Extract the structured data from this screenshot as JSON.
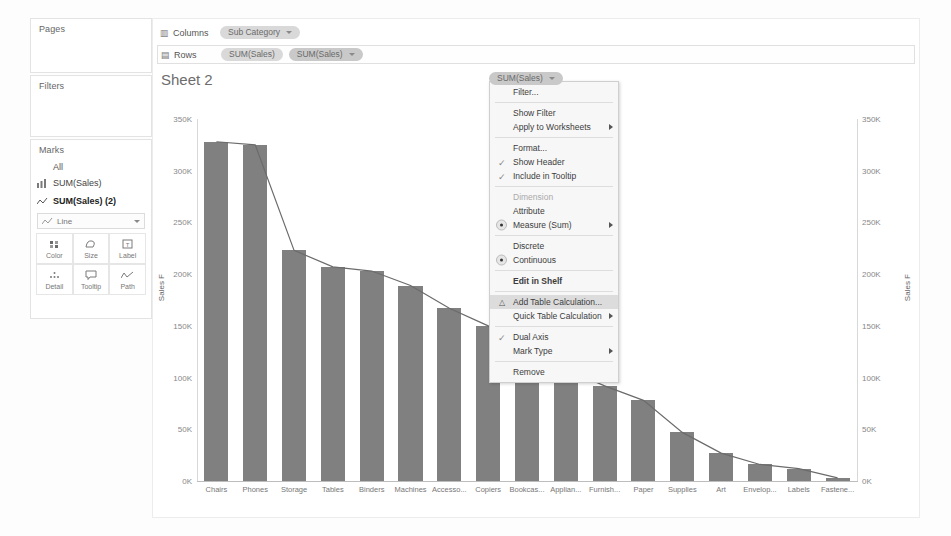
{
  "left_panel": {
    "pages_label": "Pages",
    "filters_label": "Filters",
    "marks_label": "Marks",
    "marks_all": "All",
    "mark_cards": [
      {
        "label": "SUM(Sales)",
        "icon": "bar-chart-icon",
        "selected": false
      },
      {
        "label": "SUM(Sales) (2)",
        "icon": "line-chart-icon",
        "selected": true
      }
    ],
    "mark_type": "Line",
    "buttons": [
      {
        "label": "Color",
        "icon": "color-icon"
      },
      {
        "label": "Size",
        "icon": "size-icon"
      },
      {
        "label": "Label",
        "icon": "label-icon"
      },
      {
        "label": "Detail",
        "icon": "detail-icon"
      },
      {
        "label": "Tooltip",
        "icon": "tooltip-icon"
      },
      {
        "label": "Path",
        "icon": "path-icon"
      }
    ]
  },
  "shelves": {
    "columns_label": "Columns",
    "rows_label": "Rows",
    "columns_pills": [
      "Sub Category"
    ],
    "rows_pills": [
      "SUM(Sales)",
      "SUM(Sales)"
    ]
  },
  "sheet": {
    "title": "Sheet 2",
    "column_header": "Sub-Category"
  },
  "context_menu": {
    "header_pill": "SUM(Sales)",
    "items": [
      {
        "label": "Filter...",
        "type": "plain"
      },
      {
        "label": "SEPARATOR",
        "type": "sep"
      },
      {
        "label": "Show Filter",
        "type": "plain"
      },
      {
        "label": "Apply to Worksheets",
        "type": "submenu"
      },
      {
        "label": "SEPARATOR",
        "type": "sep"
      },
      {
        "label": "Format...",
        "type": "plain"
      },
      {
        "label": "Show Header",
        "type": "check"
      },
      {
        "label": "Include in Tooltip",
        "type": "check"
      },
      {
        "label": "SEPARATOR",
        "type": "sep"
      },
      {
        "label": "Dimension",
        "type": "disabled"
      },
      {
        "label": "Attribute",
        "type": "plain"
      },
      {
        "label": "Measure (Sum)",
        "type": "radio-submenu"
      },
      {
        "label": "SEPARATOR",
        "type": "sep"
      },
      {
        "label": "Discrete",
        "type": "plain"
      },
      {
        "label": "Continuous",
        "type": "radio"
      },
      {
        "label": "SEPARATOR",
        "type": "sep"
      },
      {
        "label": "Edit in Shelf",
        "type": "bold"
      },
      {
        "label": "SEPARATOR",
        "type": "sep"
      },
      {
        "label": "Add Table Calculation...",
        "type": "highlight-delta"
      },
      {
        "label": "Quick Table Calculation",
        "type": "submenu"
      },
      {
        "label": "SEPARATOR",
        "type": "sep"
      },
      {
        "label": "Dual Axis",
        "type": "check"
      },
      {
        "label": "Mark Type",
        "type": "submenu"
      },
      {
        "label": "SEPARATOR",
        "type": "sep"
      },
      {
        "label": "Remove",
        "type": "plain"
      }
    ]
  },
  "colors": {
    "bar": "#808080",
    "line": "#6b6b6b",
    "pill": "#d9d9d9",
    "menu_highlight": "#dcdcdc"
  },
  "chart_data": {
    "type": "bar",
    "title": "Sheet 2",
    "xlabel": "Sub-Category",
    "ylabel": "Sales F",
    "ylabel_right": "Sales F",
    "ylim": [
      0,
      350000
    ],
    "ytick_labels": [
      "0K",
      "50K",
      "100K",
      "150K",
      "200K",
      "250K",
      "300K",
      "350K"
    ],
    "ytick_values": [
      0,
      50000,
      100000,
      150000,
      200000,
      250000,
      300000,
      350000
    ],
    "grid": false,
    "legend": "none",
    "categories": [
      "Chairs",
      "Phones",
      "Storage",
      "Tables",
      "Binders",
      "Machines",
      "Accesso...",
      "Copiers",
      "Bookcas...",
      "Applian...",
      "Furnish...",
      "Paper",
      "Supplies",
      "Art",
      "Envelop...",
      "Labels",
      "Fastene..."
    ],
    "series": [
      {
        "name": "SUM(Sales)",
        "mark": "bar",
        "values": [
          328000,
          325000,
          223000,
          207000,
          203000,
          189000,
          167000,
          150000,
          115000,
          108000,
          92000,
          78000,
          47000,
          27000,
          16000,
          12000,
          3000
        ]
      },
      {
        "name": "SUM(Sales) (2)",
        "mark": "line",
        "values": [
          328000,
          325000,
          223000,
          207000,
          203000,
          189000,
          167000,
          150000,
          115000,
          108000,
          92000,
          78000,
          47000,
          27000,
          16000,
          12000,
          3000
        ]
      }
    ]
  }
}
